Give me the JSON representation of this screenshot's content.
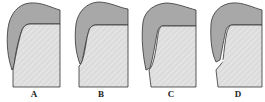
{
  "figure": {
    "panels": [
      {
        "id": "A",
        "label": "A",
        "label_x": 24
      },
      {
        "id": "B",
        "label": "B",
        "label_x": 91
      },
      {
        "id": "C",
        "label": "C",
        "label_x": 161
      },
      {
        "id": "D",
        "label": "D",
        "label_x": 228
      }
    ]
  },
  "colors": {
    "outer_layer": "#a8a8a8",
    "inner_body": "#dcdcdc",
    "hatch": "#eeeeee",
    "outline": "#333333",
    "label": "#222222"
  }
}
